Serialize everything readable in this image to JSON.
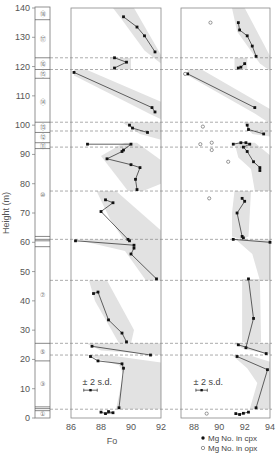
{
  "chart_data": {
    "type": "scatter",
    "title": "",
    "ylabel": "Height (m)",
    "ylim": [
      0,
      140
    ],
    "yticks": [
      0,
      10,
      20,
      30,
      40,
      50,
      60,
      70,
      80,
      90,
      100,
      110,
      120,
      130,
      140
    ],
    "unit_boundaries_m": [
      123,
      119,
      101,
      98,
      92.5,
      77.5,
      61,
      47,
      25.5,
      21.5,
      3
    ],
    "layer_strip": {
      "lines_m": [
        136,
        123,
        119,
        116,
        101,
        97.5,
        94,
        92,
        62,
        61,
        60.5,
        58.5,
        25.5,
        19.5,
        3.8,
        3.2,
        2.5
      ],
      "labels": [
        {
          "text": "⑱",
          "h": 138
        },
        {
          "text": "⑰",
          "h": 129.5
        },
        {
          "text": "⑯",
          "h": 121
        },
        {
          "text": "⑮",
          "h": 117.5
        },
        {
          "text": "⑭",
          "h": 108
        },
        {
          "text": "⑬",
          "h": 99.5
        },
        {
          "text": "⑫",
          "h": 96
        },
        {
          "text": "⑪",
          "h": 93
        },
        {
          "text": "⑩",
          "h": 76
        },
        {
          "text": "⑦",
          "h": 42
        },
        {
          "text": "⑤",
          "h": 22.5
        },
        {
          "text": "③",
          "h": 11.5
        },
        {
          "text": "①",
          "h": 1.3
        }
      ]
    },
    "panels": [
      {
        "name": "olivine",
        "xlabel": "Fo",
        "xlim": [
          86,
          92
        ],
        "xticks": [
          86,
          88,
          90,
          92
        ],
        "series": [
          {
            "name": "Fo in olivine",
            "marker": "filled",
            "segments": [
              [
                [
                  89.5,
                  137
                ],
                [
                  90.4,
                  133.5
                ],
                [
                  90.9,
                  130.5
                ],
                [
                  91.6,
                  125
                ]
              ],
              [
                [
                  88.9,
                  123
                ],
                [
                  89.7,
                  121.5
                ],
                [
                  88.9,
                  119.5
                ]
              ],
              [
                [
                  86.2,
                  118
                ],
                [
                  91.4,
                  106
                ],
                [
                  91.6,
                  104.5
                ]
              ],
              [
                [
                  89.9,
                  100
                ],
                [
                  90.1,
                  99
                ],
                [
                  91.1,
                  97.5
                ]
              ],
              [
                [
                  87.1,
                  93.5
                ],
                [
                  90.0,
                  93.5
                ],
                [
                  89.5,
                  91.5
                ],
                [
                  89.4,
                  91
                ],
                [
                  88.4,
                  88.5
                ],
                [
                  90.0,
                  86.5
                ],
                [
                  90.6,
                  85.5
                ],
                [
                  90.3,
                  81.5
                ],
                [
                  90.4,
                  78
                ]
              ],
              [
                [
                  88.3,
                  74.5
                ],
                [
                  88.8,
                  73.5
                ],
                [
                  88.0,
                  70.5
                ],
                [
                  89.8,
                  61
                ],
                [
                  89.9,
                  60.5
                ]
              ],
              [
                [
                  86.3,
                  60.5
                ],
                [
                  90.2,
                  59
                ],
                [
                  90.2,
                  58
                ],
                [
                  90.0,
                  56
                ],
                [
                  91.7,
                  47.5
                ]
              ],
              [
                [
                  87.5,
                  42.5
                ],
                [
                  87.8,
                  43
                ],
                [
                  88.5,
                  33.5
                ],
                [
                  89.4,
                  29
                ],
                [
                  89.7,
                  26
                ]
              ],
              [
                [
                  87.4,
                  24.5
                ],
                [
                  91.3,
                  21.5
                ]
              ],
              [
                [
                  87.3,
                  21
                ],
                [
                  87.8,
                  19.5
                ],
                [
                  89.4,
                  18.5
                ],
                [
                  89.5,
                  17
                ],
                [
                  89.2,
                  3.5
                ]
              ],
              [
                [
                  88.0,
                  2
                ],
                [
                  88.3,
                  1.5
                ],
                [
                  88.8,
                  1.8
                ],
                [
                  88.5,
                  2.2
                ]
              ]
            ]
          }
        ],
        "sd_label": "± 2 s.d.",
        "sd_bar": {
          "x": 87.3,
          "h": 9.5,
          "halfwidth": 0.45
        }
      },
      {
        "name": "pyroxene",
        "xlabel": "",
        "xlim": [
          87,
          94.2
        ],
        "xticks": [
          88,
          90,
          92,
          94
        ],
        "series": [
          {
            "name": "Mg No. in cpx",
            "marker": "filled",
            "segments": [
              [
                [
                  91.5,
                  135
                ],
                [
                  91.6,
                  132.5
                ],
                [
                  92.2,
                  130.5
                ],
                [
                  92.6,
                  127
                ],
                [
                  92.9,
                  123.5
                ]
              ],
              [
                [
                  91.5,
                  119.5
                ],
                [
                  91.7,
                  119.8
                ],
                [
                  92.0,
                  121
                ]
              ],
              [
                [
                  87.5,
                  117.5
                ],
                [
                  92.8,
                  106
                ]
              ],
              [
                [
                  92.2,
                  100
                ],
                [
                  92.3,
                  98.5
                ],
                [
                  93.5,
                  97
                ]
              ],
              [
                [
                  91.1,
                  93.5
                ],
                [
                  91.7,
                  94
                ],
                [
                  92.1,
                  94
                ],
                [
                  92.4,
                  93.5
                ],
                [
                  91.9,
                  92.5
                ],
                [
                  92.2,
                  91
                ],
                [
                  92.7,
                  87.5
                ],
                [
                  93.2,
                  85.5
                ],
                [
                  93.2,
                  84.5
                ]
              ],
              [
                [
                  91.8,
                  75
                ],
                [
                  92.0,
                  74
                ],
                [
                  91.4,
                  70
                ],
                [
                  91.8,
                  62
                ],
                [
                  91.9,
                  61.5
                ]
              ],
              [
                [
                  91.1,
                  61
                ],
                [
                  94.0,
                  60
                ]
              ],
              [
                [
                  92.3,
                  47.5
                ],
                [
                  92.7,
                  34
                ],
                [
                  92.1,
                  24
                ]
              ],
              [
                [
                  91.5,
                  25
                ],
                [
                  93.7,
                  22
                ]
              ],
              [
                [
                  91.4,
                  21
                ],
                [
                  93.8,
                  16.5
                ],
                [
                  92.9,
                  3.5
                ]
              ],
              [
                [
                  91.3,
                  1.5
                ],
                [
                  91.6,
                  1.2
                ],
                [
                  91.9,
                  1.6
                ],
                [
                  92.3,
                  2
                ]
              ]
            ]
          },
          {
            "name": "Mg No. in opx",
            "marker": "open",
            "points": [
              [
                89.3,
                135
              ],
              [
                87.3,
                117.5
              ],
              [
                88.7,
                99.5
              ],
              [
                88.5,
                93.5
              ],
              [
                89.4,
                94
              ],
              [
                89.4,
                91.5
              ],
              [
                90.7,
                87.5
              ],
              [
                89.2,
                75
              ],
              [
                89.0,
                1.5
              ]
            ]
          }
        ],
        "sd_label": "± 2 s.d.",
        "sd_bar": {
          "x": 88.6,
          "h": 9.5,
          "halfwidth": 0.45
        }
      }
    ],
    "legend": [
      {
        "marker": "filled",
        "label": "Mg No. in cpx"
      },
      {
        "marker": "open",
        "label": "Mg No. in opx"
      }
    ],
    "bands": [
      {
        "panel": 0,
        "poly": [
          [
            88.8,
            140
          ],
          [
            90.2,
            140
          ],
          [
            92,
            124
          ],
          [
            92,
            121
          ],
          [
            90.9,
            125.5
          ],
          [
            89.4,
            136
          ]
        ]
      },
      {
        "panel": 0,
        "poly": [
          [
            88.6,
            123
          ],
          [
            90.0,
            123
          ],
          [
            90.0,
            119
          ],
          [
            88.6,
            119
          ]
        ]
      },
      {
        "panel": 0,
        "poly": [
          [
            86.2,
            119
          ],
          [
            87.0,
            119
          ],
          [
            92,
            108
          ],
          [
            92,
            102
          ],
          [
            91.2,
            104
          ],
          [
            86.2,
            117
          ]
        ]
      },
      {
        "panel": 0,
        "poly": [
          [
            89.4,
            101
          ],
          [
            92,
            101
          ],
          [
            92,
            95
          ],
          [
            90.6,
            97
          ]
        ]
      },
      {
        "panel": 0,
        "poly": [
          [
            89.6,
            94
          ],
          [
            90.4,
            94
          ],
          [
            92,
            88
          ],
          [
            92,
            80
          ],
          [
            90.8,
            77.5
          ],
          [
            89.8,
            77.5
          ],
          [
            88.0,
            89.5
          ],
          [
            89.2,
            93
          ]
        ]
      },
      {
        "panel": 0,
        "poly": [
          [
            87.7,
            77.5
          ],
          [
            89.0,
            77.5
          ],
          [
            92,
            64
          ],
          [
            92,
            60.5
          ],
          [
            89.5,
            61
          ],
          [
            88.6,
            68
          ]
        ]
      },
      {
        "panel": 0,
        "poly": [
          [
            86.3,
            61
          ],
          [
            92,
            61
          ],
          [
            92,
            47
          ],
          [
            91.0,
            47
          ],
          [
            89.6,
            57
          ]
        ]
      },
      {
        "panel": 0,
        "poly": [
          [
            87.2,
            47
          ],
          [
            88.4,
            47
          ],
          [
            90.2,
            30
          ],
          [
            90.0,
            25.5
          ],
          [
            89.2,
            25.5
          ],
          [
            87.6,
            40
          ]
        ]
      },
      {
        "panel": 0,
        "poly": [
          [
            87.0,
            25.5
          ],
          [
            92,
            25.5
          ],
          [
            92,
            21.5
          ],
          [
            88.0,
            23
          ]
        ]
      },
      {
        "panel": 0,
        "poly": [
          [
            87.0,
            21.5
          ],
          [
            88.4,
            21.5
          ],
          [
            92,
            19
          ],
          [
            92,
            3
          ],
          [
            89.0,
            3
          ],
          [
            89.5,
            15
          ],
          [
            89.2,
            18
          ]
        ]
      },
      {
        "panel": 1,
        "poly": [
          [
            91.0,
            140
          ],
          [
            92.0,
            140
          ],
          [
            94.2,
            122
          ],
          [
            94.2,
            118
          ],
          [
            93.2,
            121
          ],
          [
            91.4,
            132
          ]
        ]
      },
      {
        "panel": 1,
        "poly": [
          [
            91.2,
            123
          ],
          [
            92.2,
            123
          ],
          [
            92.2,
            119
          ],
          [
            91.2,
            119
          ]
        ]
      },
      {
        "panel": 1,
        "poly": [
          [
            87.5,
            119
          ],
          [
            88.6,
            119
          ],
          [
            94.2,
            105
          ],
          [
            94.2,
            100
          ],
          [
            92.8,
            104
          ],
          [
            87.5,
            117
          ]
        ]
      },
      {
        "panel": 1,
        "poly": [
          [
            91.9,
            101
          ],
          [
            94.2,
            101
          ],
          [
            94.2,
            96
          ],
          [
            92.6,
            97
          ]
        ]
      },
      {
        "panel": 1,
        "poly": [
          [
            91.2,
            94
          ],
          [
            92.8,
            94
          ],
          [
            94.2,
            89
          ],
          [
            94.2,
            77.5
          ],
          [
            92.8,
            77.5
          ],
          [
            92.5,
            85
          ],
          [
            91.5,
            89
          ]
        ]
      },
      {
        "panel": 1,
        "poly": [
          [
            91.2,
            77.5
          ],
          [
            92.5,
            77.5
          ],
          [
            92.3,
            62
          ],
          [
            91.8,
            61
          ],
          [
            91.0,
            62
          ],
          [
            91.0,
            70
          ]
        ]
      },
      {
        "panel": 1,
        "poly": [
          [
            91.3,
            61
          ],
          [
            94.0,
            61
          ],
          [
            94.2,
            47
          ],
          [
            93.2,
            47
          ],
          [
            92.6,
            56
          ]
        ]
      },
      {
        "panel": 1,
        "poly": [
          [
            91.8,
            47.5
          ],
          [
            93.2,
            47.5
          ],
          [
            93.3,
            26
          ],
          [
            92.6,
            25
          ],
          [
            91.8,
            26
          ]
        ]
      },
      {
        "panel": 1,
        "poly": [
          [
            91.0,
            25.5
          ],
          [
            94.2,
            25.5
          ],
          [
            94.2,
            21.5
          ],
          [
            92.0,
            23.5
          ]
        ]
      },
      {
        "panel": 1,
        "poly": [
          [
            91.0,
            21.5
          ],
          [
            92.3,
            21.5
          ],
          [
            94.2,
            19
          ],
          [
            94.2,
            3
          ],
          [
            92.4,
            3
          ],
          [
            93.0,
            12
          ],
          [
            92.2,
            17
          ]
        ]
      }
    ]
  }
}
